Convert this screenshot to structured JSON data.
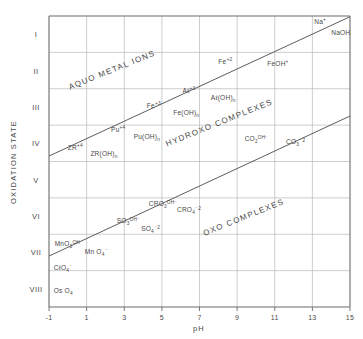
{
  "chart_data": {
    "type": "scatter",
    "title": "",
    "xlabel": "pH",
    "ylabel": "OXIDATION STATE",
    "xlim": [
      -1,
      15
    ],
    "ylim": [
      0.5,
      8.5
    ],
    "grid": true,
    "legend_position": "none",
    "x_ticks": [
      "-1",
      "1",
      "3",
      "5",
      "7",
      "9",
      "11",
      "13",
      "15"
    ],
    "x_tick_values": [
      -1,
      1,
      3,
      5,
      7,
      9,
      11,
      13,
      15
    ],
    "y_ticks": [
      "I",
      "II",
      "III",
      "IV",
      "V",
      "VI",
      "VII",
      "VIII"
    ],
    "y_tick_values": [
      1,
      2,
      3,
      4,
      5,
      6,
      7,
      8
    ],
    "boundaries": [
      {
        "name": "aquo-hydroxo-boundary",
        "x": [
          -1,
          15
        ],
        "y": [
          4.35,
          0.52
        ]
      },
      {
        "name": "hydroxo-oxo-boundary",
        "x": [
          -1,
          15
        ],
        "y": [
          7.1,
          3.25
        ]
      }
    ],
    "regions": [
      {
        "label": "AQUO METAL IONS",
        "x": 2.4,
        "y": 2.05,
        "rotation": -22
      },
      {
        "label": "HYDROXO COMPLEXES",
        "x": 8.1,
        "y": 3.5,
        "rotation": -22
      },
      {
        "label": "OXO COMPLEXES",
        "x": 9.4,
        "y": 6.1,
        "rotation": -22
      }
    ],
    "annotations": [
      {
        "species": "Na",
        "charge": "+",
        "sub": "",
        "x": 13.1,
        "y": 0.72
      },
      {
        "species": "NaOH",
        "charge": "",
        "sub": "",
        "x": 14.0,
        "y": 1.02
      },
      {
        "species": "Fe",
        "charge": "+2",
        "sub": "",
        "x": 8.0,
        "y": 1.82
      },
      {
        "species": "FeOH",
        "charge": "+",
        "sub": "",
        "x": 10.6,
        "y": 1.88
      },
      {
        "species": "Aℓ",
        "charge": "+3",
        "sub": "",
        "x": 6.1,
        "y": 2.62
      },
      {
        "species": "Aℓ(OH)",
        "charge": "",
        "sub": "n",
        "x": 7.6,
        "y": 2.82
      },
      {
        "species": "Fe",
        "charge": "+3",
        "sub": "",
        "x": 4.2,
        "y": 3.02
      },
      {
        "species": "Fe(OH)",
        "charge": "",
        "sub": "n",
        "x": 5.6,
        "y": 3.22
      },
      {
        "species": "Pu",
        "charge": "+4",
        "sub": "",
        "x": 2.3,
        "y": 3.7
      },
      {
        "species": "Pu(OH)",
        "charge": "",
        "sub": "n",
        "x": 3.5,
        "y": 3.88
      },
      {
        "species": "ZR",
        "charge": "+4",
        "sub": "",
        "x": 0.0,
        "y": 4.18
      },
      {
        "species": "ZR(OH)",
        "charge": "",
        "sub": "n",
        "x": 1.2,
        "y": 4.36
      },
      {
        "species": "CO",
        "charge": "OH⁻",
        "sub": "2",
        "x": 9.4,
        "y": 3.94
      },
      {
        "species": "CO",
        "charge": "⁻2",
        "sub": "3",
        "x": 11.6,
        "y": 4.02
      },
      {
        "species": "CRO",
        "charge": "OH⁻",
        "sub": "3",
        "x": 4.3,
        "y": 5.72
      },
      {
        "species": "CRO",
        "charge": "⁻2",
        "sub": "4",
        "x": 5.8,
        "y": 5.88
      },
      {
        "species": "SO",
        "charge": "OH⁻",
        "sub": "3",
        "x": 2.6,
        "y": 6.2
      },
      {
        "species": "SO",
        "charge": "⁻2",
        "sub": "4",
        "x": 3.9,
        "y": 6.42
      },
      {
        "species": "MnO",
        "charge": "OH",
        "sub": "3",
        "x": -0.7,
        "y": 6.82
      },
      {
        "species": "Mn O",
        "charge": "⁻",
        "sub": "4",
        "x": 0.9,
        "y": 7.04
      },
      {
        "species": "CℓO",
        "charge": "⁻",
        "sub": "4",
        "x": -0.75,
        "y": 7.48
      },
      {
        "species": "Os O",
        "charge": "",
        "sub": "4",
        "x": -0.75,
        "y": 8.12
      }
    ]
  }
}
